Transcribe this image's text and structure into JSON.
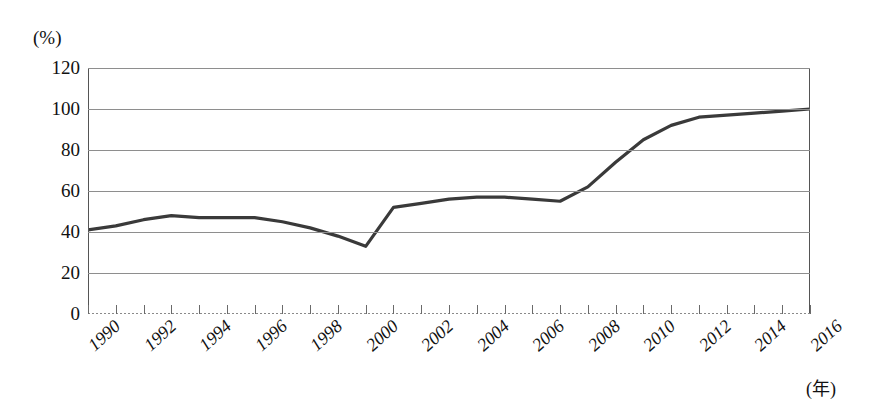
{
  "figure": {
    "unit_label": "(%)",
    "x_axis_unit": "(年)"
  },
  "chart_data": {
    "type": "line",
    "title": "",
    "xlabel": "(年)",
    "ylabel": "(%)",
    "ylim": [
      0,
      120
    ],
    "xlim": [
      1990,
      2016
    ],
    "grid": true,
    "legend": null,
    "y_ticks": [
      0,
      20,
      40,
      60,
      80,
      100,
      120
    ],
    "x_tick_labels": [
      "1990",
      "1992",
      "1994",
      "1996",
      "1998",
      "2000",
      "2002",
      "2004",
      "2006",
      "2008",
      "2010",
      "2012",
      "2014",
      "2016"
    ],
    "x_tick_label_step": 2,
    "x_minor_tick_step": 1,
    "series": [
      {
        "name": "",
        "color": "#3a3a3a",
        "x": [
          1990,
          1991,
          1992,
          1993,
          1994,
          1995,
          1996,
          1997,
          1998,
          1999,
          2000,
          2001,
          2002,
          2003,
          2004,
          2005,
          2006,
          2007,
          2008,
          2009,
          2010,
          2011,
          2012,
          2013,
          2014,
          2015,
          2016
        ],
        "values": [
          41,
          43,
          46,
          48,
          47,
          47,
          47,
          45,
          42,
          38,
          33,
          52,
          54,
          56,
          57,
          57,
          56,
          55,
          62,
          74,
          85,
          92,
          96,
          97,
          98,
          99,
          100
        ]
      }
    ]
  }
}
